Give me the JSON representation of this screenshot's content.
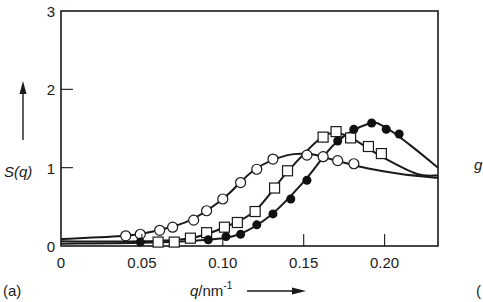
{
  "chart_data": {
    "type": "line",
    "title": "",
    "panel_label": "(a)",
    "xlabel": "q/nm⁻¹",
    "ylabel": "S(q)",
    "xlim": [
      0,
      0.233
    ],
    "ylim": [
      0,
      3
    ],
    "x_ticks": [
      0,
      0.05,
      0.1,
      0.15,
      0.2
    ],
    "x_tick_labels": [
      "0",
      "0.05",
      "0.10",
      "0.15",
      "0.20"
    ],
    "y_ticks": [
      0,
      1,
      2,
      3
    ],
    "y_tick_labels": [
      "0",
      "1",
      "2",
      "3"
    ],
    "grid": false,
    "legend": "none",
    "series": [
      {
        "name": "open circles",
        "marker": "open-circle",
        "points": [
          [
            0.04,
            0.13
          ],
          [
            0.049,
            0.15
          ],
          [
            0.061,
            0.2
          ],
          [
            0.069,
            0.24
          ],
          [
            0.082,
            0.33
          ],
          [
            0.09,
            0.45
          ],
          [
            0.1,
            0.6
          ],
          [
            0.111,
            0.81
          ],
          [
            0.121,
            0.98
          ],
          [
            0.131,
            1.11
          ],
          [
            0.152,
            1.16
          ],
          [
            0.162,
            1.14
          ],
          [
            0.171,
            1.09
          ],
          [
            0.181,
            1.05
          ]
        ],
        "curve": [
          [
            0,
            0.09
          ],
          [
            0.04,
            0.13
          ],
          [
            0.06,
            0.2
          ],
          [
            0.08,
            0.33
          ],
          [
            0.1,
            0.6
          ],
          [
            0.12,
            0.98
          ],
          [
            0.14,
            1.16
          ],
          [
            0.155,
            1.17
          ],
          [
            0.17,
            1.09
          ],
          [
            0.19,
            0.99
          ],
          [
            0.21,
            0.92
          ],
          [
            0.233,
            0.87
          ]
        ]
      },
      {
        "name": "open squares",
        "marker": "open-square",
        "points": [
          [
            0.06,
            0.05
          ],
          [
            0.07,
            0.05
          ],
          [
            0.08,
            0.1
          ],
          [
            0.09,
            0.17
          ],
          [
            0.101,
            0.24
          ],
          [
            0.109,
            0.3
          ],
          [
            0.12,
            0.44
          ],
          [
            0.132,
            0.74
          ],
          [
            0.14,
            0.96
          ],
          [
            0.162,
            1.39
          ],
          [
            0.17,
            1.46
          ],
          [
            0.179,
            1.38
          ],
          [
            0.19,
            1.27
          ],
          [
            0.198,
            1.18
          ]
        ],
        "curve": [
          [
            0,
            0.06
          ],
          [
            0.05,
            0.06
          ],
          [
            0.08,
            0.1
          ],
          [
            0.1,
            0.23
          ],
          [
            0.12,
            0.45
          ],
          [
            0.14,
            0.95
          ],
          [
            0.16,
            1.37
          ],
          [
            0.17,
            1.44
          ],
          [
            0.18,
            1.37
          ],
          [
            0.2,
            1.12
          ],
          [
            0.22,
            0.92
          ],
          [
            0.233,
            0.9
          ]
        ]
      },
      {
        "name": "filled circles",
        "marker": "filled-circle",
        "points": [
          [
            0.049,
            0.05
          ],
          [
            0.091,
            0.08
          ],
          [
            0.102,
            0.12
          ],
          [
            0.111,
            0.15
          ],
          [
            0.121,
            0.27
          ],
          [
            0.131,
            0.41
          ],
          [
            0.142,
            0.6
          ],
          [
            0.152,
            0.84
          ],
          [
            0.171,
            1.34
          ],
          [
            0.181,
            1.49
          ],
          [
            0.192,
            1.57
          ],
          [
            0.201,
            1.49
          ],
          [
            0.209,
            1.43
          ]
        ],
        "curve": [
          [
            0,
            0.03
          ],
          [
            0.05,
            0.04
          ],
          [
            0.09,
            0.08
          ],
          [
            0.11,
            0.15
          ],
          [
            0.13,
            0.4
          ],
          [
            0.15,
            0.82
          ],
          [
            0.17,
            1.32
          ],
          [
            0.19,
            1.56
          ],
          [
            0.2,
            1.52
          ],
          [
            0.215,
            1.3
          ],
          [
            0.233,
            1.0
          ]
        ]
      }
    ]
  },
  "figure": {
    "panel_label": "(a)",
    "y_axis_label": "S(q)",
    "x_axis_label_main": "q",
    "x_axis_label_unit": "/nm",
    "x_axis_label_exp": "-1",
    "cropped_next_panel_label": "g",
    "cropped_next_panel_paren": "("
  }
}
